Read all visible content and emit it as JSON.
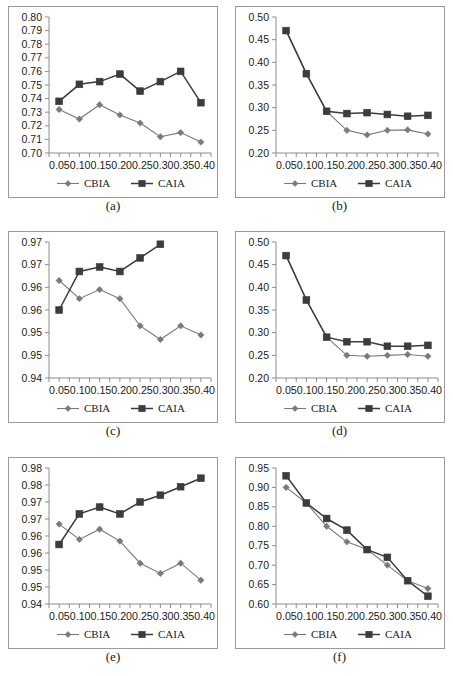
{
  "figure": {
    "panel_count": 6,
    "series_names": [
      "CBIA",
      "CAIA"
    ],
    "colors": {
      "cbia": "#7a7a7a",
      "caia": "#3c3c3c",
      "axis": "#8c8c8c",
      "border": "#9a9a9a",
      "text": "#1a1a1a",
      "background": "#ffffff"
    }
  },
  "chart_data": [
    {
      "id": "a",
      "caption": "(a)",
      "type": "line",
      "title": "",
      "xlabel": "",
      "ylabel": "",
      "x": [
        0.05,
        0.1,
        0.15,
        0.2,
        0.25,
        0.3,
        0.35,
        0.4
      ],
      "xtick_labels": [
        "0.05",
        "0.10",
        "0.15",
        "0.20",
        "0.25",
        "0.30",
        "0.35",
        "0.40"
      ],
      "ytick_labels": [
        "0.80",
        "0.79",
        "0.78",
        "0.77",
        "0.76",
        "0.75",
        "0.74",
        "0.73",
        "0.72",
        "0.71",
        "0.70"
      ],
      "ylim": [
        0.7,
        0.8
      ],
      "xlim": [
        0.025,
        0.425
      ],
      "grid": false,
      "legend_position": "bottom",
      "series": [
        {
          "name": "CBIA",
          "marker": "diamond",
          "values": [
            0.732,
            0.725,
            0.7355,
            0.728,
            0.722,
            0.712,
            0.715,
            0.708
          ]
        },
        {
          "name": "CAIA",
          "marker": "square",
          "values": [
            0.738,
            0.7505,
            0.7525,
            0.758,
            0.7455,
            0.7525,
            0.76,
            0.737
          ]
        }
      ]
    },
    {
      "id": "b",
      "caption": "(b)",
      "type": "line",
      "title": "",
      "xlabel": "",
      "ylabel": "",
      "x": [
        0.05,
        0.1,
        0.15,
        0.2,
        0.25,
        0.3,
        0.35,
        0.4
      ],
      "xtick_labels": [
        "0.05",
        "0.10",
        "0.15",
        "0.20",
        "0.25",
        "0.30",
        "0.35",
        "0.40"
      ],
      "ytick_labels": [
        "0.50",
        "0.45",
        "0.40",
        "0.35",
        "0.30",
        "0.25",
        "0.20"
      ],
      "ylim": [
        0.2,
        0.5
      ],
      "xlim": [
        0.025,
        0.425
      ],
      "grid": false,
      "legend_position": "bottom",
      "series": [
        {
          "name": "CBIA",
          "marker": "diamond",
          "values": [
            0.47,
            0.375,
            0.292,
            0.25,
            0.24,
            0.25,
            0.251,
            0.242
          ]
        },
        {
          "name": "CAIA",
          "marker": "square",
          "values": [
            0.47,
            0.375,
            0.292,
            0.287,
            0.289,
            0.285,
            0.281,
            0.283
          ]
        }
      ]
    },
    {
      "id": "c",
      "caption": "(c)",
      "type": "line",
      "title": "",
      "xlabel": "",
      "ylabel": "",
      "x": [
        0.05,
        0.1,
        0.15,
        0.2,
        0.25,
        0.3,
        0.35,
        0.4
      ],
      "xtick_labels": [
        "0.05",
        "0.10",
        "0.15",
        "0.20",
        "0.25",
        "0.30",
        "0.35",
        "0.40"
      ],
      "ytick_labels": [
        "0.97",
        "0.97",
        "0.96",
        "0.96",
        "0.95",
        "0.95",
        "0.94"
      ],
      "ylim": [
        0.945,
        0.975
      ],
      "xlim": [
        0.025,
        0.425
      ],
      "grid": false,
      "legend_position": "bottom",
      "series": [
        {
          "name": "CBIA",
          "marker": "diamond",
          "values": [
            0.9665,
            0.9625,
            0.9645,
            0.9625,
            0.9565,
            0.9535,
            0.9565,
            0.9545
          ]
        },
        {
          "name": "CAIA",
          "marker": "square",
          "values": [
            0.96,
            0.9685,
            0.9695,
            0.9685,
            0.9715,
            0.9745,
            null,
            null
          ]
        }
      ]
    },
    {
      "id": "d",
      "caption": "(d)",
      "type": "line",
      "title": "",
      "xlabel": "",
      "ylabel": "",
      "x": [
        0.05,
        0.1,
        0.15,
        0.2,
        0.25,
        0.3,
        0.35,
        0.4
      ],
      "xtick_labels": [
        "0.05",
        "0.10",
        "0.15",
        "0.20",
        "0.25",
        "0.30",
        "0.35",
        "0.40"
      ],
      "ytick_labels": [
        "0.50",
        "0.45",
        "0.40",
        "0.35",
        "0.30",
        "0.25",
        "0.20"
      ],
      "ylim": [
        0.2,
        0.5
      ],
      "xlim": [
        0.025,
        0.425
      ],
      "grid": false,
      "legend_position": "bottom",
      "series": [
        {
          "name": "CBIA",
          "marker": "diamond",
          "values": [
            0.47,
            0.372,
            0.29,
            0.25,
            0.248,
            0.25,
            0.252,
            0.248
          ]
        },
        {
          "name": "CAIA",
          "marker": "square",
          "values": [
            0.47,
            0.372,
            0.29,
            0.28,
            0.28,
            0.27,
            0.27,
            0.272
          ]
        }
      ]
    },
    {
      "id": "e",
      "caption": "(e)",
      "type": "line",
      "title": "",
      "xlabel": "",
      "ylabel": "",
      "x": [
        0.05,
        0.1,
        0.15,
        0.2,
        0.25,
        0.3,
        0.35,
        0.4
      ],
      "xtick_labels": [
        "0.05",
        "0.10",
        "0.15",
        "0.20",
        "0.25",
        "0.30",
        "0.35",
        "0.40"
      ],
      "ytick_labels": [
        "0.98",
        "0.98",
        "0.97",
        "0.97",
        "0.96",
        "0.96",
        "0.95",
        "0.95",
        "0.94"
      ],
      "ylim": [
        0.9425,
        0.9825
      ],
      "xlim": [
        0.025,
        0.425
      ],
      "grid": false,
      "legend_position": "bottom",
      "series": [
        {
          "name": "CBIA",
          "marker": "diamond",
          "values": [
            0.966,
            0.9615,
            0.9645,
            0.961,
            0.9545,
            0.9515,
            0.9545,
            0.9495
          ]
        },
        {
          "name": "CAIA",
          "marker": "square",
          "values": [
            0.96,
            0.969,
            0.971,
            0.969,
            0.9725,
            0.9745,
            0.977,
            0.9795
          ]
        }
      ]
    },
    {
      "id": "f",
      "caption": "(f)",
      "type": "line",
      "title": "",
      "xlabel": "",
      "ylabel": "",
      "x": [
        0.05,
        0.1,
        0.15,
        0.2,
        0.25,
        0.3,
        0.35,
        0.4
      ],
      "xtick_labels": [
        "0.05",
        "0.10",
        "0.15",
        "0.20",
        "0.25",
        "0.30",
        "0.35",
        "0.40"
      ],
      "ytick_labels": [
        "0.95",
        "0.90",
        "0.85",
        "0.80",
        "0.75",
        "0.70",
        "0.65",
        "0.60"
      ],
      "ylim": [
        0.6,
        0.95
      ],
      "xlim": [
        0.025,
        0.425
      ],
      "grid": false,
      "legend_position": "bottom",
      "series": [
        {
          "name": "CBIA",
          "marker": "diamond",
          "values": [
            0.9,
            0.86,
            0.8,
            0.76,
            0.74,
            0.7,
            0.66,
            0.64
          ]
        },
        {
          "name": "CAIA",
          "marker": "square",
          "values": [
            0.93,
            0.86,
            0.82,
            0.79,
            0.74,
            0.72,
            0.66,
            0.62
          ]
        }
      ]
    }
  ]
}
